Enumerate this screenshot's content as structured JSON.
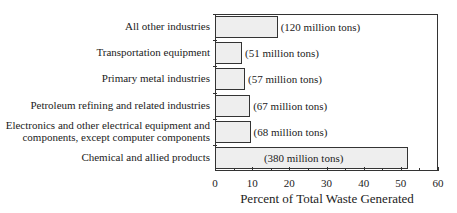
{
  "chart_data": {
    "type": "bar",
    "orientation": "horizontal",
    "title": "",
    "xlabel": "Percent of Total Waste Generated",
    "ylabel": "",
    "xlim": [
      0,
      60
    ],
    "xticks": [
      0,
      10,
      20,
      30,
      40,
      50,
      60
    ],
    "grid": false,
    "legend": null,
    "categories": [
      "All other industries",
      "Transportation equipment",
      "Primary metal industries",
      "Petroleum refining and related industries",
      "Electronics and other electrical equipment and components, except computer components",
      "Chemical and allied products"
    ],
    "category_lines": [
      [
        "All other industries"
      ],
      [
        "Transportation equipment"
      ],
      [
        "Primary metal industries"
      ],
      [
        "Petroleum refining and related industries"
      ],
      [
        "Electronics and other electrical equipment and",
        "components, except computer components"
      ],
      [
        "Chemical and allied products"
      ]
    ],
    "values": [
      16.6,
      7.0,
      7.8,
      9.2,
      9.3,
      51.6
    ],
    "annotations": [
      "(120 million tons)",
      "(51 million tons)",
      "(57 million tons)",
      "(67 million tons)",
      "(68 million tons)",
      "(380 million tons)"
    ],
    "tons_million": [
      120,
      51,
      57,
      67,
      68,
      380
    ],
    "bar_color": "#eeeeee",
    "edge_color": "#333333"
  }
}
